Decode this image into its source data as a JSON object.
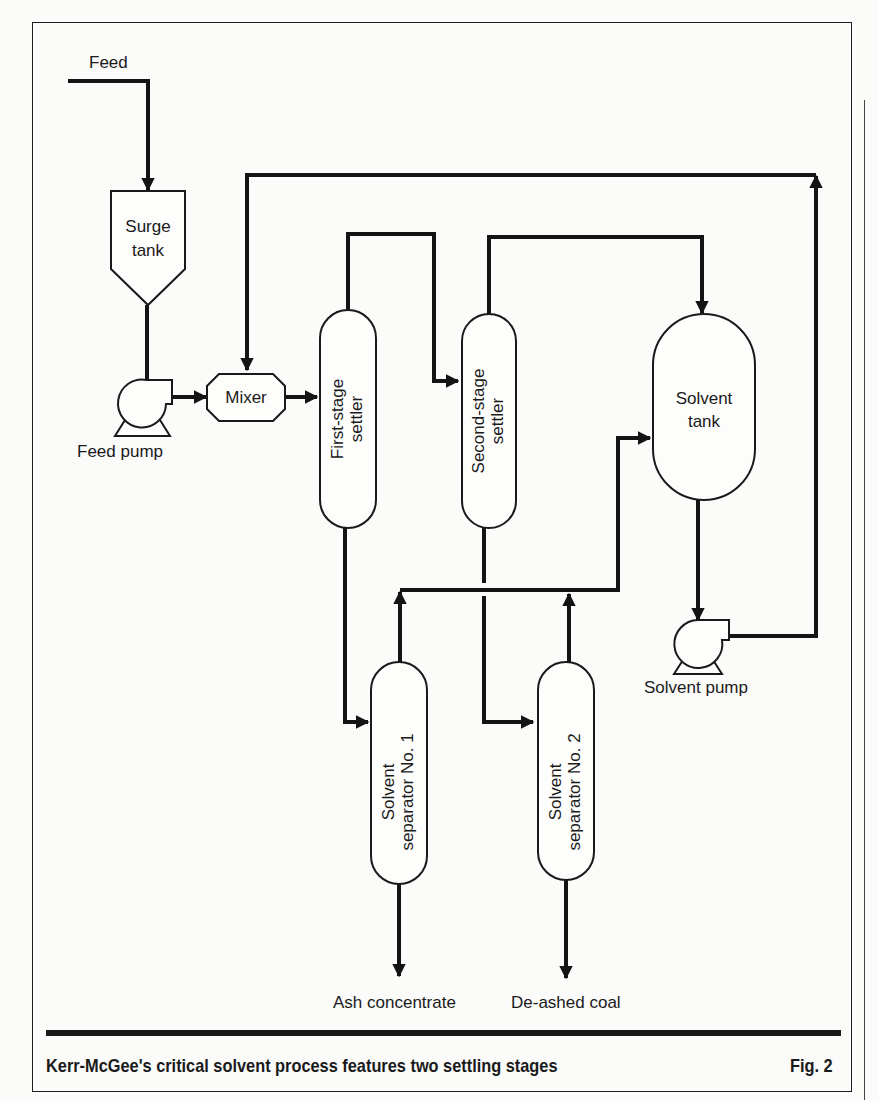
{
  "figure": {
    "caption": "Kerr-McGee's critical solvent process features two settling stages",
    "figure_number": "Fig. 2"
  },
  "streams": {
    "feed": "Feed",
    "ash_concentrate": "Ash concentrate",
    "deashed_coal": "De-ashed coal"
  },
  "equipment": {
    "surge_tank": {
      "line1": "Surge",
      "line2": "tank"
    },
    "feed_pump": "Feed pump",
    "mixer": "Mixer",
    "first_stage_settler": {
      "line1": "First-stage",
      "line2": "settler"
    },
    "second_stage_settler": {
      "line1": "Second-stage",
      "line2": "settler"
    },
    "solvent_tank": {
      "line1": "Solvent",
      "line2": "tank"
    },
    "solvent_pump": "Solvent pump",
    "solvent_separator_1": {
      "line1": "Solvent",
      "line2": "separator No. 1"
    },
    "solvent_separator_2": {
      "line1": "Solvent",
      "line2": "separator No. 2"
    }
  },
  "colors": {
    "ink": "#1a1a1a",
    "paper": "#fbfbfa"
  }
}
